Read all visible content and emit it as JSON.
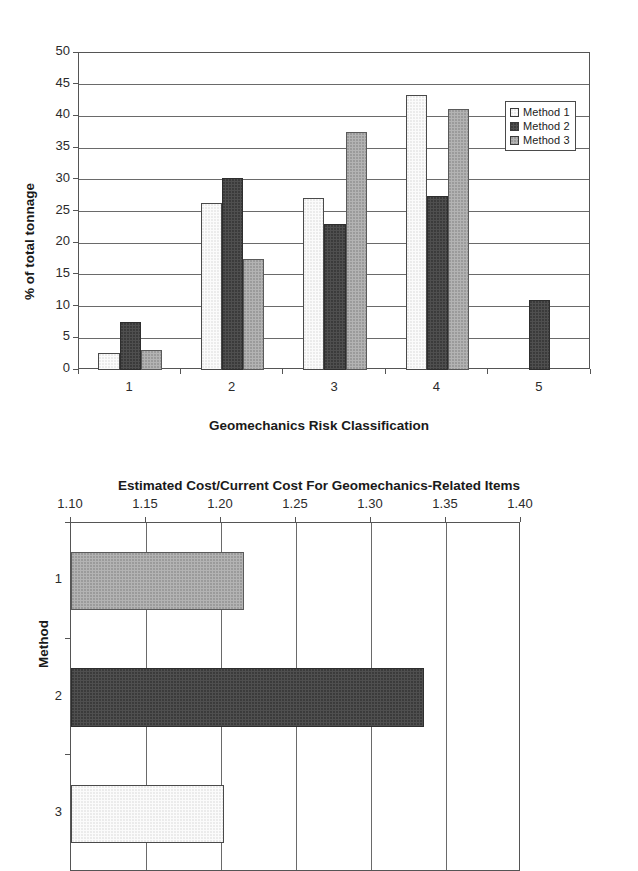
{
  "chart_data": [
    {
      "id": "tonnage-by-risk-class",
      "type": "bar",
      "orientation": "vertical",
      "title": "",
      "xlabel": "Geomechanics Risk Classification",
      "ylabel": "% of total tonnage",
      "categories": [
        "1",
        "2",
        "3",
        "4",
        "5"
      ],
      "ylim": [
        0,
        50
      ],
      "yticks": [
        "0",
        "5",
        "10",
        "15",
        "20",
        "25",
        "30",
        "35",
        "40",
        "45",
        "50"
      ],
      "grid": true,
      "legend_position": "top-right",
      "series": [
        {
          "name": "Method 1",
          "color": "#fbfbfb",
          "values": [
            2.7,
            26.3,
            27.1,
            43.3,
            0
          ]
        },
        {
          "name": "Method 2",
          "color": "#4f4f4f",
          "values": [
            7.5,
            30.3,
            23.0,
            27.4,
            11.0
          ]
        },
        {
          "name": "Method 3",
          "color": "#b3b3b3",
          "values": [
            3.2,
            17.5,
            37.6,
            41.1,
            0
          ]
        }
      ]
    },
    {
      "id": "estimated-cost-ratio-by-method",
      "type": "bar",
      "orientation": "horizontal",
      "title": "Estimated Cost/Current Cost For Geomechanics-Related Items",
      "xlabel": "",
      "ylabel": "Method",
      "categories": [
        "1",
        "2",
        "3"
      ],
      "xlim": [
        1.1,
        1.4
      ],
      "xticks": [
        "1.10",
        "1.15",
        "1.20",
        "1.25",
        "1.30",
        "1.35",
        "1.40"
      ],
      "grid": true,
      "series": [
        {
          "name": "Estimated Cost Ratio",
          "values": [
            1.215,
            1.335,
            1.202
          ],
          "colors": [
            "#b3b3b3",
            "#4f4f4f",
            "#f2f2f2"
          ]
        }
      ]
    }
  ]
}
